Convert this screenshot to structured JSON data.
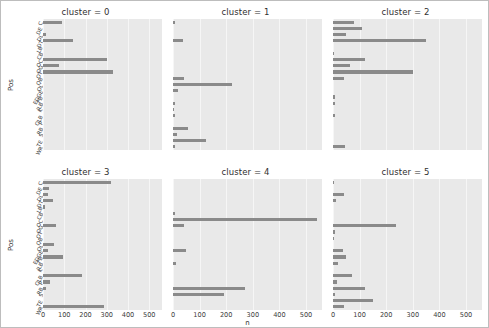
{
  "figure": {
    "background": "#ffffff",
    "axes_background": "#e9e9e9",
    "bar_color": "#8a8a8a",
    "grid_color": "#f6f6f6"
  },
  "axis": {
    "ylabel": "Pos",
    "xlabel": "n",
    "xticks": [
      "0",
      "100",
      "200",
      "300",
      "400",
      "500"
    ],
    "xlim": [
      0,
      560
    ],
    "categories": [
      "C",
      "DE",
      "DL",
      "DT",
      "LB",
      "CB",
      "OC",
      "OG",
      "OT",
      "QB",
      "OL",
      "EDGE",
      "FB",
      "ILB",
      "K",
      "OLB",
      "P",
      "RB",
      "S",
      "TE",
      "WR"
    ]
  },
  "chart_data": {
    "type": "bar",
    "title": "",
    "xlabel": "n",
    "ylabel": "Pos",
    "xlim": [
      0,
      560
    ],
    "grid": true,
    "legend": null,
    "orientation": "horizontal",
    "facet_variable": "cluster",
    "categories": [
      "C",
      "DE",
      "DL",
      "DT",
      "LB",
      "CB",
      "OC",
      "OG",
      "OT",
      "QB",
      "OL",
      "EDGE",
      "FB",
      "ILB",
      "K",
      "OLB",
      "P",
      "RB",
      "S",
      "TE",
      "WR"
    ],
    "facets": [
      {
        "title": "cluster = 0",
        "cluster": 0,
        "values": [
          88,
          0,
          12,
          140,
          0,
          0,
          300,
          77,
          330,
          0,
          0,
          0,
          0,
          0,
          0,
          0,
          0,
          0,
          0,
          0,
          0
        ]
      },
      {
        "title": "cluster = 1",
        "cluster": 1,
        "values": [
          6,
          0,
          0,
          38,
          0,
          0,
          0,
          0,
          0,
          40,
          220,
          18,
          0,
          8,
          5,
          7,
          0,
          55,
          16,
          125,
          6,
          0
        ]
      },
      {
        "title": "cluster = 2",
        "cluster": 2,
        "values": [
          80,
          110,
          48,
          350,
          0,
          5,
          120,
          65,
          300,
          42,
          0,
          0,
          8,
          6,
          0,
          9,
          0,
          0,
          0,
          0,
          45
        ]
      },
      {
        "title": "cluster = 3",
        "cluster": 3,
        "values": [
          320,
          30,
          22,
          45,
          8,
          0,
          0,
          60,
          0,
          0,
          52,
          25,
          95,
          0,
          0,
          185,
          35,
          12,
          0,
          0,
          285
        ]
      },
      {
        "title": "cluster = 4",
        "cluster": 4,
        "values": [
          0,
          0,
          0,
          0,
          0,
          6,
          540,
          40,
          0,
          0,
          0,
          48,
          0,
          10,
          0,
          0,
          0,
          270,
          190,
          0,
          0,
          300
        ]
      },
      {
        "title": "cluster = 5",
        "cluster": 5,
        "values": [
          5,
          0,
          40,
          10,
          0,
          0,
          0,
          235,
          6,
          5,
          0,
          38,
          50,
          18,
          0,
          70,
          14,
          120,
          8,
          150,
          40,
          0,
          95
        ]
      }
    ]
  },
  "facet_titles": [
    "cluster = 0",
    "cluster = 1",
    "cluster = 2",
    "cluster = 3",
    "cluster = 4",
    "cluster = 5"
  ]
}
